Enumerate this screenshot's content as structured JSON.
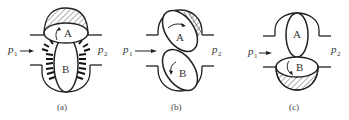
{
  "figure": {
    "panels": [
      {
        "id": "a",
        "caption": "(a)",
        "rotor_top": "A",
        "rotor_bottom": "B",
        "inlet_label": "p",
        "inlet_sub": "1",
        "outlet_label": "p",
        "outlet_sub": "2",
        "state": "Rotor A horizontal (hatched trapped volume above), rotor B vertical with pressure arrows on both sides"
      },
      {
        "id": "b",
        "caption": "(b)",
        "rotor_top": "A",
        "rotor_bottom": "B",
        "inlet_label": "p",
        "inlet_sub": "1",
        "outlet_label": "p",
        "outlet_sub": "2",
        "state": "Both rotors tilted diagonally, hatched region at upper-right of A"
      },
      {
        "id": "c",
        "caption": "(c)",
        "rotor_top": "A",
        "rotor_bottom": "B",
        "inlet_label": "p",
        "inlet_sub": "1",
        "outlet_label": "p",
        "outlet_sub": "2",
        "state": "Rotor A vertical, rotor B horizontal (hatched trapped volume below)"
      }
    ]
  }
}
